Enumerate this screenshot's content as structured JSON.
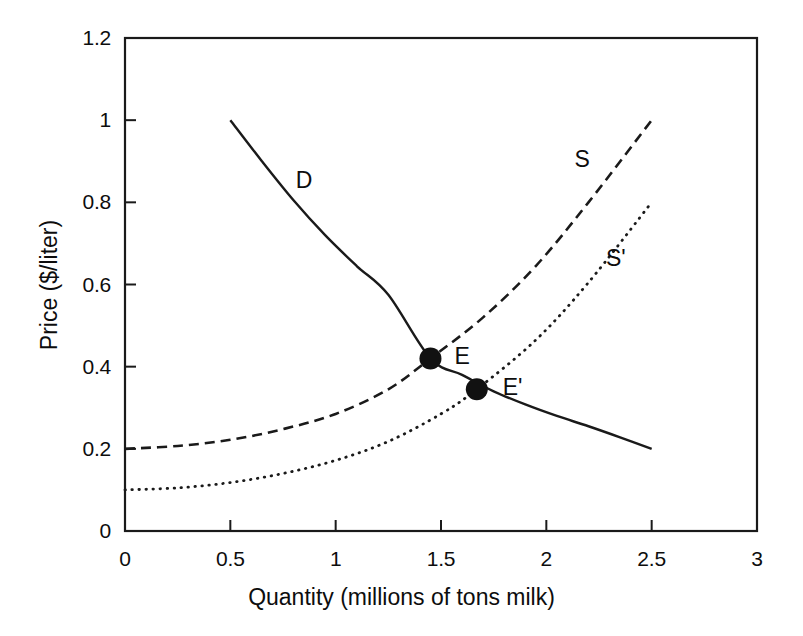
{
  "chart_data": {
    "type": "line",
    "title": "",
    "xlabel": "Quantity (millions of tons milk)",
    "ylabel": "Price ($/liter)",
    "xlim": [
      0,
      3
    ],
    "ylim": [
      0,
      1.2
    ],
    "xticks": [
      "0",
      "0.5",
      "1",
      "1.5",
      "2",
      "2.5",
      "3"
    ],
    "xtick_values": [
      0,
      0.5,
      1,
      1.5,
      2,
      2.5,
      3
    ],
    "yticks": [
      "0",
      "0.2",
      "0.4",
      "0.6",
      "0.8",
      "1",
      "1.2"
    ],
    "ytick_values": [
      0,
      0.2,
      0.4,
      0.6,
      0.8,
      1.0,
      1.2
    ],
    "grid": false,
    "legend_position": "inline-curve-labels",
    "series": [
      {
        "name": "D",
        "label": "D",
        "style": "solid",
        "label_x": 0.85,
        "label_y": 0.855,
        "x": [
          0.5,
          0.65,
          0.8,
          0.95,
          1.1,
          1.25,
          1.45,
          1.6,
          1.75,
          1.9,
          2.05,
          2.2,
          2.35,
          2.5
        ],
        "y": [
          1.0,
          0.9,
          0.805,
          0.72,
          0.645,
          0.575,
          0.42,
          0.38,
          0.34,
          0.308,
          0.28,
          0.255,
          0.228,
          0.2
        ]
      },
      {
        "name": "S",
        "label": "S",
        "style": "dashed",
        "label_x": 2.17,
        "label_y": 0.905,
        "x": [
          0.0,
          0.25,
          0.5,
          0.75,
          1.0,
          1.25,
          1.45,
          1.7,
          1.95,
          2.2,
          2.5
        ],
        "y": [
          0.2,
          0.207,
          0.222,
          0.248,
          0.285,
          0.345,
          0.42,
          0.52,
          0.645,
          0.8,
          1.0
        ]
      },
      {
        "name": "S'",
        "label": "S'",
        "style": "dotted",
        "label_x": 2.33,
        "label_y": 0.665,
        "x": [
          0.0,
          0.25,
          0.5,
          0.75,
          1.0,
          1.25,
          1.5,
          1.67,
          1.95,
          2.2,
          2.5
        ],
        "y": [
          0.1,
          0.105,
          0.118,
          0.14,
          0.172,
          0.218,
          0.285,
          0.345,
          0.465,
          0.605,
          0.8
        ]
      }
    ],
    "annotations": [
      {
        "name": "E",
        "label": "E",
        "marker": "filled-circle",
        "x": 1.45,
        "y": 0.42,
        "label_x": 1.6,
        "label_y": 0.425
      },
      {
        "name": "E'",
        "label": "E'",
        "marker": "filled-circle",
        "x": 1.67,
        "y": 0.345,
        "label_x": 1.84,
        "label_y": 0.35
      }
    ],
    "colors": {
      "axis": "#1a1a1a",
      "curve": "#1a1a1a",
      "marker": "#111111",
      "background": "#ffffff"
    }
  }
}
